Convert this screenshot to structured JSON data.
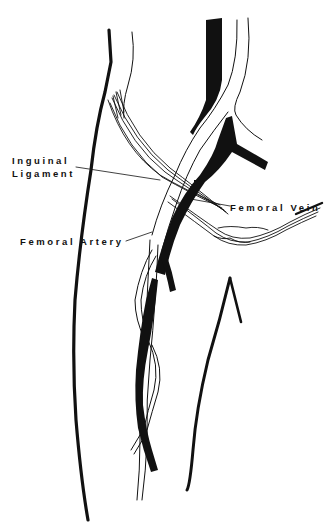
{
  "diagram": {
    "labels": {
      "inguinal_ligament_line1": "Inguinal",
      "inguinal_ligament_line2": "Ligament",
      "femoral_vein": "Femoral Vein",
      "femoral_artery": "Femoral Artery"
    },
    "colors": {
      "background": "#ffffff",
      "ink": "#111111"
    }
  }
}
